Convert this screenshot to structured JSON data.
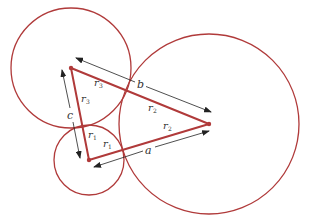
{
  "diagram": {
    "type": "three mutually tangent circles with triangle of centers",
    "colors": {
      "circle_stroke": "#b03a3a",
      "triangle_stroke": "#b03a3a",
      "arrow": "#333333",
      "label": "#333333"
    },
    "circles": [
      {
        "id": "circle-1",
        "cx": 89,
        "cy": 160,
        "r": 35
      },
      {
        "id": "circle-2",
        "cx": 209,
        "cy": 124,
        "r": 90
      },
      {
        "id": "circle-3",
        "cx": 71,
        "cy": 68,
        "r": 60
      }
    ],
    "centers": {
      "c1": [
        89,
        160
      ],
      "c2": [
        209,
        124
      ],
      "c3": [
        71,
        68
      ]
    },
    "side_labels": {
      "a": "a",
      "b": "b",
      "c": "c"
    },
    "radius_labels": {
      "r1_main": "r",
      "r1_sub": "1",
      "r2_main": "r",
      "r2_sub": "2",
      "r3_main": "r",
      "r3_sub": "3"
    }
  }
}
